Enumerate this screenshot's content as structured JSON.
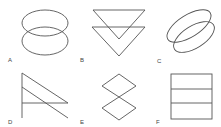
{
  "figure": {
    "panels": [
      {
        "label": "A",
        "shape": "two vertically stacked overlapping ellipses"
      },
      {
        "label": "B",
        "shape": "two stacked overlapping downward-pointing triangles"
      },
      {
        "label": "C",
        "shape": "two tilted overlapping ellipses"
      },
      {
        "label": "D",
        "shape": "vertical line with two parallel diagonals and a horizontal line"
      },
      {
        "label": "E",
        "shape": "two diamonds touching at a vertex"
      },
      {
        "label": "F",
        "shape": "rectangle divided by two horizontal lines into three bands"
      }
    ],
    "stroke_color": "#555555",
    "background": "#ffffff"
  }
}
